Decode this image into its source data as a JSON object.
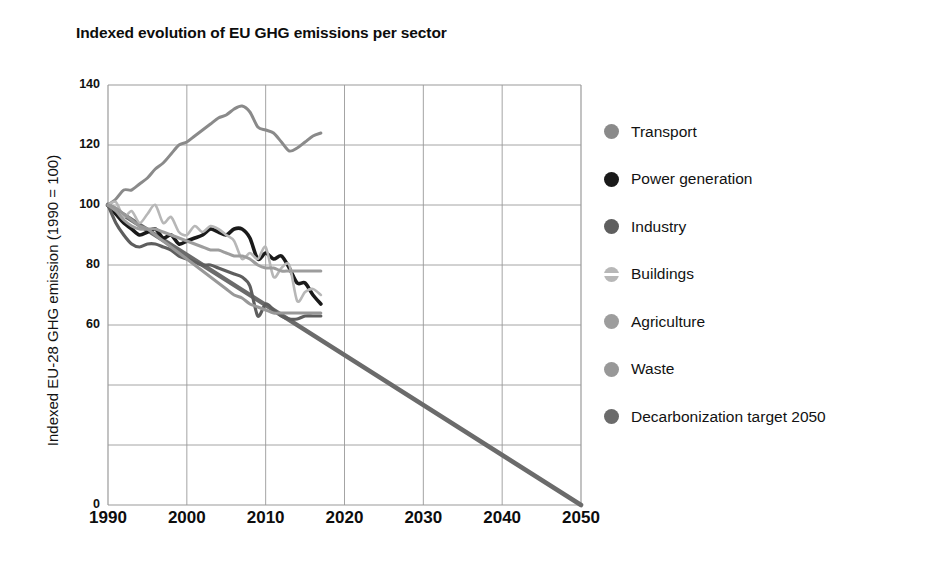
{
  "chart": {
    "title": "Indexed evolution of EU GHG emissions per sector",
    "ylabel": "Indexed EU-28 GHG emission (1990 = 100)",
    "xlabel": ""
  },
  "legend": {
    "items": [
      {
        "label": "Transport",
        "color": "#8a8a8a",
        "marker": "circle"
      },
      {
        "label": "Power generation",
        "color": "#1a1a1a",
        "marker": "circle"
      },
      {
        "label": "Industry",
        "color": "#5e5e5e",
        "marker": "circle"
      },
      {
        "label": "Buildings",
        "color": "#b7b7b7",
        "marker": "circle-split"
      },
      {
        "label": "Agriculture",
        "color": "#9d9d9d",
        "marker": "circle"
      },
      {
        "label": "Waste",
        "color": "#989898",
        "marker": "circle"
      },
      {
        "label": "Decarbonization target 2050",
        "color": "#6b6b6b",
        "marker": "circle"
      }
    ]
  },
  "axes": {
    "y_ticks": [
      {
        "value": 140,
        "label": "140"
      },
      {
        "value": 120,
        "label": "120"
      },
      {
        "value": 100,
        "label": "100"
      },
      {
        "value": 80,
        "label": "80"
      },
      {
        "value": 60,
        "label": "60"
      },
      {
        "value": 40,
        "label": ""
      },
      {
        "value": 20,
        "label": ""
      },
      {
        "value": 0,
        "label": "0"
      }
    ],
    "x_ticks": [
      {
        "value": 1990,
        "label": "1990"
      },
      {
        "value": 2000,
        "label": "2000"
      },
      {
        "value": 2010,
        "label": "2010"
      },
      {
        "value": 2020,
        "label": "2020"
      },
      {
        "value": 2030,
        "label": "2030"
      },
      {
        "value": 2040,
        "label": "2040"
      },
      {
        "value": 2050,
        "label": "2050"
      }
    ]
  },
  "chart_data": {
    "type": "line",
    "title": "Indexed evolution of EU GHG emissions per sector",
    "xlabel": "",
    "ylabel": "Indexed EU-28 GHG emission (1990 = 100)",
    "xlim": [
      1990,
      2050
    ],
    "ylim": [
      0,
      140
    ],
    "grid": true,
    "legend_position": "right",
    "x": [
      1990,
      1991,
      1992,
      1993,
      1994,
      1995,
      1996,
      1997,
      1998,
      1999,
      2000,
      2001,
      2002,
      2003,
      2004,
      2005,
      2006,
      2007,
      2008,
      2009,
      2010,
      2011,
      2012,
      2013,
      2014,
      2015,
      2016,
      2017
    ],
    "series": [
      {
        "name": "Transport",
        "color": "#8a8a8a",
        "values": [
          100,
          102,
          105,
          105,
          107,
          109,
          112,
          114,
          117,
          120,
          121,
          123,
          125,
          127,
          129,
          130,
          132,
          133,
          131,
          126,
          125,
          124,
          121,
          118,
          119,
          121,
          123,
          124
        ]
      },
      {
        "name": "Power generation",
        "color": "#1a1a1a",
        "values": [
          100,
          97,
          94,
          92,
          90,
          91,
          92,
          89,
          90,
          87,
          88,
          89,
          90,
          92,
          91,
          90,
          92,
          92,
          89,
          82,
          84,
          82,
          83,
          79,
          74,
          74,
          70,
          67
        ]
      },
      {
        "name": "Industry",
        "color": "#5e5e5e",
        "values": [
          100,
          94,
          90,
          87,
          86,
          87,
          87,
          86,
          85,
          83,
          82,
          81,
          80,
          80,
          79,
          78,
          77,
          76,
          73,
          63,
          67,
          65,
          63,
          62,
          62,
          63,
          63,
          63
        ]
      },
      {
        "name": "Buildings",
        "color": "#b7b7b7",
        "values": [
          100,
          101,
          96,
          98,
          94,
          97,
          100,
          94,
          96,
          91,
          90,
          93,
          91,
          93,
          92,
          90,
          88,
          82,
          84,
          82,
          86,
          76,
          79,
          80,
          68,
          71,
          72,
          70
        ]
      },
      {
        "name": "Agriculture",
        "color": "#9d9d9d",
        "values": [
          100,
          98,
          95,
          93,
          92,
          92,
          92,
          91,
          90,
          89,
          88,
          87,
          86,
          85,
          85,
          84,
          83,
          83,
          82,
          80,
          79,
          79,
          78,
          78,
          78,
          78,
          78,
          78
        ]
      },
      {
        "name": "Waste",
        "color": "#989898",
        "values": [
          100,
          99,
          97,
          95,
          93,
          92,
          90,
          88,
          86,
          84,
          82,
          80,
          78,
          76,
          74,
          72,
          70,
          69,
          67,
          66,
          65,
          64,
          64,
          64,
          64,
          64,
          64,
          64
        ]
      }
    ],
    "target_line": {
      "name": "Decarbonization target 2050",
      "color": "#6b6b6b",
      "x": [
        1990,
        2050
      ],
      "values": [
        100,
        0
      ]
    }
  }
}
